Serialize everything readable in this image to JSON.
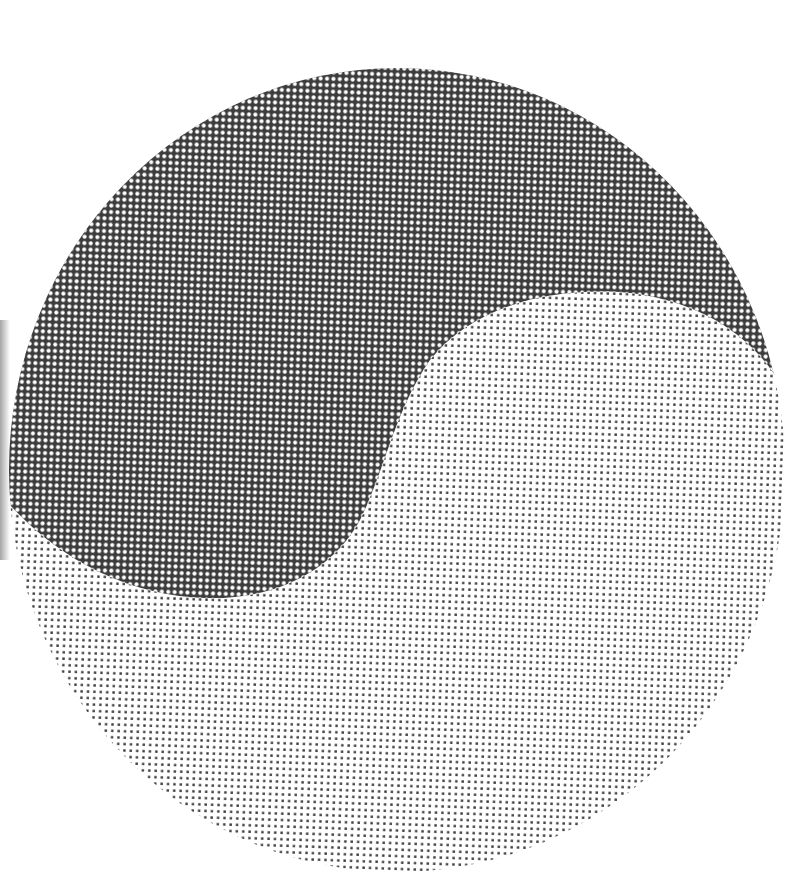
{
  "image": {
    "title": "Halftone yin-yang circle",
    "description": "Circular halftone graphic split by an S-curve into a dark region (top-left) and a light region (bottom-right)",
    "colors": {
      "background": "#ffffff",
      "dark_ink": "#3a3a3a",
      "light_dot": "#3a3a3a",
      "dark_region_dot": "#ffffff"
    },
    "regions": [
      {
        "name": "dark-half",
        "tone": "dark halftone (white dots on dark field)"
      },
      {
        "name": "light-half",
        "tone": "light halftone (dark dots on white field)"
      }
    ]
  }
}
